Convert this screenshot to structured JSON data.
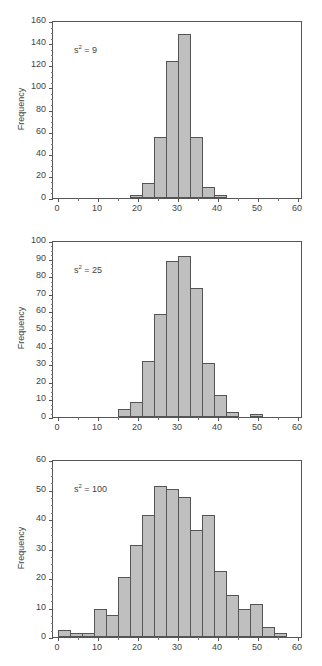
{
  "chart_data": [
    {
      "type": "bar",
      "title": "",
      "annotation": {
        "base": "s",
        "exponent": "2",
        "text": " = 9"
      },
      "xlabel": "",
      "ylabel": "Frequency",
      "xlim": [
        0,
        60
      ],
      "ylim": [
        0,
        160
      ],
      "xticks": [
        0,
        10,
        20,
        30,
        40,
        50,
        60
      ],
      "yticks": [
        0,
        20,
        40,
        60,
        80,
        100,
        120,
        140,
        160
      ],
      "bin_width": 3,
      "bins": [
        [
          18,
          21
        ],
        [
          21,
          24
        ],
        [
          24,
          27
        ],
        [
          27,
          30
        ],
        [
          30,
          33
        ],
        [
          33,
          36
        ],
        [
          36,
          39
        ],
        [
          39,
          42
        ]
      ],
      "values": [
        2,
        13,
        54,
        123,
        147,
        54,
        9,
        2
      ],
      "grid": false
    },
    {
      "type": "bar",
      "title": "",
      "annotation": {
        "base": "s",
        "exponent": "2",
        "text": " = 25"
      },
      "xlabel": "",
      "ylabel": "Frequency",
      "xlim": [
        0,
        60
      ],
      "ylim": [
        0,
        100
      ],
      "xticks": [
        0,
        10,
        20,
        30,
        40,
        50,
        60
      ],
      "yticks": [
        0,
        10,
        20,
        30,
        40,
        50,
        60,
        70,
        80,
        90,
        100
      ],
      "bin_width": 3,
      "bins": [
        [
          15,
          18
        ],
        [
          18,
          21
        ],
        [
          21,
          24
        ],
        [
          24,
          27
        ],
        [
          27,
          30
        ],
        [
          30,
          33
        ],
        [
          33,
          36
        ],
        [
          36,
          39
        ],
        [
          39,
          42
        ],
        [
          42,
          45
        ],
        [
          45,
          48
        ],
        [
          48,
          51
        ]
      ],
      "values": [
        4,
        8,
        31,
        58,
        88,
        91,
        73,
        30,
        12,
        2,
        0,
        1
      ],
      "grid": false
    },
    {
      "type": "bar",
      "title": "",
      "annotation": {
        "base": "s",
        "exponent": "2",
        "text": " = 100"
      },
      "xlabel": "",
      "ylabel": "Frequency",
      "xlim": [
        0,
        60
      ],
      "ylim": [
        0,
        60
      ],
      "xticks": [
        0,
        10,
        20,
        30,
        40,
        50,
        60
      ],
      "yticks": [
        0,
        10,
        20,
        30,
        40,
        50,
        60
      ],
      "bin_width": 3,
      "bins": [
        [
          0,
          3
        ],
        [
          3,
          6
        ],
        [
          6,
          9
        ],
        [
          9,
          12
        ],
        [
          12,
          15
        ],
        [
          15,
          18
        ],
        [
          18,
          21
        ],
        [
          21,
          24
        ],
        [
          24,
          27
        ],
        [
          27,
          30
        ],
        [
          30,
          33
        ],
        [
          33,
          36
        ],
        [
          36,
          39
        ],
        [
          39,
          42
        ],
        [
          42,
          45
        ],
        [
          45,
          48
        ],
        [
          48,
          51
        ],
        [
          51,
          54
        ],
        [
          54,
          57
        ]
      ],
      "values": [
        2,
        1,
        1,
        9,
        7,
        20,
        31,
        41,
        51,
        50,
        47,
        36,
        41,
        22,
        14,
        9,
        11,
        3,
        1
      ],
      "grid": false
    }
  ],
  "colors": {
    "bar_fill": "#bfbfbf",
    "bar_edge": "#555555",
    "axis": "#555555",
    "text": "#444444"
  }
}
